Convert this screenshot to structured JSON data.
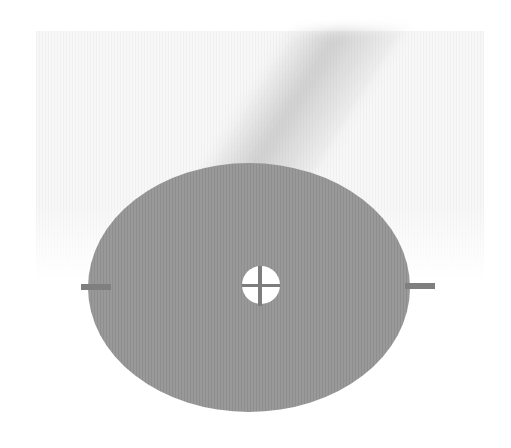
{
  "image": {
    "description": "Gray disc with central cross-shaped hole and two side tabs on a light textured background",
    "colors": {
      "background": "#ffffff",
      "backdrop": "#f4f4f4",
      "disc": "#949494",
      "tabs": "#7f7f7f",
      "hole": "#ffffff"
    }
  }
}
